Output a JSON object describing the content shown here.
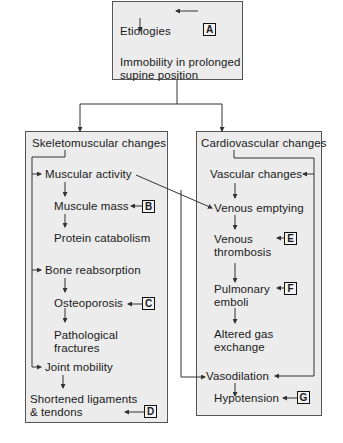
{
  "diagram": {
    "type": "flowchart",
    "top": {
      "etiologies": "Etiologies",
      "immobility_line1": "Immobility in prolonged",
      "immobility_line2": "supine position",
      "label": "A"
    },
    "skeletomuscular": {
      "title": "Skeletomuscular changes",
      "muscular_activity": "Muscular activity",
      "muscle_mass": "Muscule mass",
      "muscle_mass_label": "B",
      "protein_catabolism": "Protein catabolism",
      "bone_reabsorption": "Bone reabsorption",
      "osteoporosis": "Osteoporosis",
      "osteoporosis_label": "C",
      "pathological_line1": "Pathological",
      "pathological_line2": "fractures",
      "joint_mobility": "Joint mobility",
      "shortened_line1": "Shortened ligaments",
      "shortened_line2": "& tendons",
      "shortened_label": "D"
    },
    "cardiovascular": {
      "title": "Cardiovascular changes",
      "vascular_changes": "Vascular changes",
      "venous_emptying": "Venous emptying",
      "venous_thrombosis_line1": "Venous",
      "venous_thrombosis_line2": "thrombosis",
      "venous_thrombosis_label": "E",
      "pulmonary_line1": "Pulmonary",
      "pulmonary_line2": "emboli",
      "pulmonary_label": "F",
      "altered_line1": "Altered gas",
      "altered_line2": "exchange",
      "vasodilation": "Vasodilation",
      "hypotension": "Hypotension",
      "hypotension_label": "G"
    }
  },
  "colors": {
    "box_fill": "#ececec",
    "line": "#333333"
  }
}
